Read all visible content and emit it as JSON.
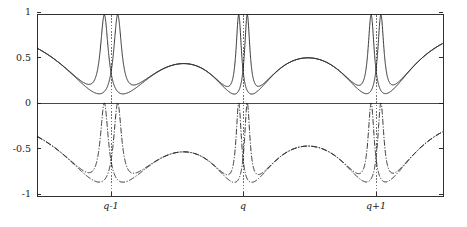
{
  "figure": {
    "title": "",
    "background_color": "#ffffff",
    "curve_color": "#111111",
    "axis_color": "#1a1a1a",
    "resonance_line_color": "#333333"
  },
  "axes": {
    "plot_left_px": 37,
    "plot_right_px": 443,
    "plot_top_px": 14,
    "plot_bottom_px": 196,
    "zero_px": 103,
    "y_ticks": [
      {
        "value": 1,
        "label": "1",
        "y_px": 15
      },
      {
        "value": 0.5,
        "label": "0.5",
        "y_px": 59
      },
      {
        "value": 0,
        "label": "0",
        "y_px": 103
      },
      {
        "value": -0.5,
        "label": "-0.5",
        "y_px": 149
      },
      {
        "value": -1,
        "label": "-1",
        "y_px": 195
      }
    ],
    "x_ticks": [
      {
        "label": "q-1",
        "x_px": 111
      },
      {
        "label": "q",
        "x_px": 243
      },
      {
        "label": "q+1",
        "x_px": 376
      }
    ],
    "xlabel": "",
    "ylabel": "",
    "grid": false,
    "legend": false
  },
  "chart_data": {
    "type": "line",
    "title": "",
    "xlabel": "",
    "ylabel": "",
    "xlim": [
      0,
      1
    ],
    "ylim": [
      -1,
      1
    ],
    "x_tick_labels": [
      "q-1",
      "q",
      "q+1"
    ],
    "x_tick_positions": [
      0.1823,
      0.5074,
      0.835
    ],
    "y_tick_labels": [
      "1",
      "0.5",
      "0",
      "-0.5",
      "-1"
    ],
    "y_tick_values": [
      1,
      0.5,
      0,
      -0.5,
      -1
    ],
    "grid": false,
    "legend_position": "none",
    "annotations": [
      {
        "type": "vertical-dashed-line",
        "x": 0.1823,
        "label": "q-1"
      },
      {
        "type": "vertical-dashed-line",
        "x": 0.5074,
        "label": "q"
      },
      {
        "type": "vertical-dashed-line",
        "x": 0.835,
        "label": "q+1"
      }
    ],
    "resonances": [
      {
        "center": 0.1823,
        "width": 0.04,
        "asym_offset": 0.0165,
        "label": "q-1"
      },
      {
        "center": 0.5074,
        "width": 0.027,
        "asym_offset": 0.0105,
        "label": "q"
      },
      {
        "center": 0.835,
        "width": 0.031,
        "asym_offset": 0.012,
        "label": "q+1"
      }
    ],
    "series": [
      {
        "name": "upper-branch",
        "style": "solid",
        "description": "Starts near +0.97, dips sharply to 0 at each resonance, returns to ~0.97 between resonances",
        "baseline": 0.97,
        "dip_value": 0.0
      },
      {
        "name": "lower-branch",
        "style": "dash-dot",
        "description": "Rides near 0, plunges to -0.97 just left of each resonance, snaps back to 0",
        "baseline": 0.0,
        "dip_value": -0.97
      },
      {
        "name": "upper-secondary",
        "style": "solid",
        "description": "Mirror partner rising from 0 to +0.97 on the right flank of each resonance",
        "baseline": 0.97,
        "dip_value": 0.0
      },
      {
        "name": "lower-secondary",
        "style": "dash-dot",
        "description": "Mirror partner of the lower branch on the right flank of each resonance",
        "baseline": 0.0,
        "dip_value": -0.97
      }
    ]
  }
}
